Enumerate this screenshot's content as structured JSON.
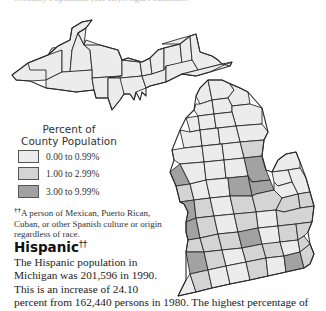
{
  "top_fragment": "...County Population (cut off)... figure continues",
  "map": {
    "subject": "Michigan counties",
    "colors": {
      "low": "#ececec",
      "mid": "#d4d4d4",
      "high": "#a2a2a2",
      "border": "#2a2a2a"
    }
  },
  "legend": {
    "title_line1": "Percent of",
    "title_line2": "County Population",
    "items": [
      {
        "label": "0.00 to 0.99%",
        "color": "#ececec"
      },
      {
        "label": "1.00 to 2.99%",
        "color": "#d4d4d4"
      },
      {
        "label": "3.00 to 9.99%",
        "color": "#a2a2a2"
      }
    ]
  },
  "footnote": {
    "marker": "††",
    "text": "A person of Mexican, Puerto Rican, Cuban, or other Spanish culture or origin regardless of race."
  },
  "heading": {
    "title": "Hispanic",
    "marker": "††"
  },
  "body": {
    "lines": [
      "The Hispanic population in",
      "Michigan was 201,596 in 1990.",
      "This is an increase of 24.10",
      "percent from 162,440 persons in 1980. The highest percentage of"
    ]
  }
}
